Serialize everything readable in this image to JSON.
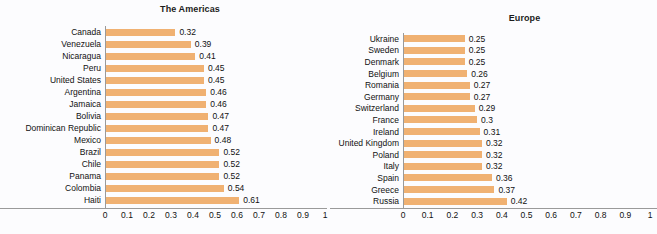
{
  "chart_data": [
    {
      "type": "bar",
      "orientation": "horizontal",
      "title": "The Americas",
      "xlabel": "",
      "ylabel": "",
      "xlim": [
        0,
        1
      ],
      "xticks": [
        "0",
        "0.1",
        "0.2",
        "0.3",
        "0.4",
        "0.5",
        "0.6",
        "0.7",
        "0.8",
        "0.9",
        "1"
      ],
      "grid": false,
      "legend": false,
      "bar_color": "#f0b172",
      "categories": [
        "Canada",
        "Venezuela",
        "Nicaragua",
        "Peru",
        "United States",
        "Argentina",
        "Jamaica",
        "Bolivia",
        "Dominican Republic",
        "Mexico",
        "Brazil",
        "Chile",
        "Panama",
        "Colombia",
        "Haiti"
      ],
      "values": [
        0.32,
        0.39,
        0.41,
        0.45,
        0.45,
        0.46,
        0.46,
        0.47,
        0.47,
        0.48,
        0.52,
        0.52,
        0.52,
        0.54,
        0.61
      ],
      "data_labels": [
        "0.32",
        "0.39",
        "0.41",
        "0.45",
        "0.45",
        "0.46",
        "0.46",
        "0.47",
        "0.47",
        "0.48",
        "0.52",
        "0.52",
        "0.52",
        "0.54",
        "0.61"
      ]
    },
    {
      "type": "bar",
      "orientation": "horizontal",
      "title": "Europe",
      "xlabel": "",
      "ylabel": "",
      "xlim": [
        0,
        1
      ],
      "xticks": [
        "0",
        "0.1",
        "0.2",
        "0.3",
        "0.4",
        "0.5",
        "0.6",
        "0.7",
        "0.8",
        "0.9",
        "1"
      ],
      "grid": false,
      "legend": false,
      "bar_color": "#f0b172",
      "categories": [
        "Ukraine",
        "Sweden",
        "Denmark",
        "Belgium",
        "Romania",
        "Germany",
        "Switzerland",
        "France",
        "Ireland",
        "United Kingdom",
        "Poland",
        "Italy",
        "Spain",
        "Greece",
        "Russia"
      ],
      "values": [
        0.25,
        0.25,
        0.25,
        0.26,
        0.27,
        0.27,
        0.29,
        0.3,
        0.31,
        0.32,
        0.32,
        0.32,
        0.36,
        0.37,
        0.42
      ],
      "data_labels": [
        "0.25",
        "0.25",
        "0.25",
        "0.26",
        "0.27",
        "0.27",
        "0.29",
        "0.3",
        "0.31",
        "0.32",
        "0.32",
        "0.32",
        "0.36",
        "0.37",
        "0.42"
      ]
    }
  ]
}
